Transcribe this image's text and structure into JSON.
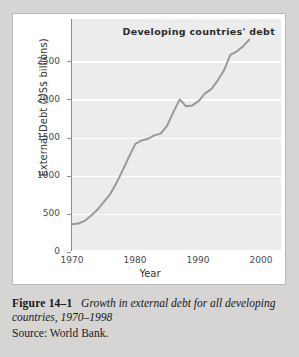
{
  "figure": {
    "label": "Figure 14–1",
    "title": "Growth in external debt for all developing countries, 1970–1998",
    "source": "Source: World Bank."
  },
  "chart_data": {
    "type": "line",
    "title": "Developing countries' debt",
    "xlabel": "Year",
    "ylabel": "External Debt (US$ billions)",
    "xlim": [
      1970,
      2003
    ],
    "ylim": [
      0,
      2700
    ],
    "xticks": [
      1970,
      1980,
      1990,
      2000
    ],
    "yticks": [
      0,
      500,
      1000,
      1500,
      2000,
      2500
    ],
    "ytick_labels": [
      "0",
      "500",
      "1000",
      "1500",
      "2000",
      "2500"
    ],
    "xtick_labels": [
      "1970",
      "1980",
      "1990",
      "2000"
    ],
    "grid": "horizontal-white",
    "legend": "none",
    "line_color": "#9a9a9a",
    "plot_background": "#ececec",
    "series": [
      {
        "name": "External debt of developing countries",
        "x": [
          1970,
          1971,
          1972,
          1973,
          1974,
          1975,
          1976,
          1977,
          1978,
          1979,
          1980,
          1981,
          1982,
          1983,
          1984,
          1985,
          1986,
          1987,
          1988,
          1989,
          1990,
          1991,
          1992,
          1993,
          1994,
          1995,
          1996,
          1997,
          1998
        ],
        "values": [
          300,
          310,
          340,
          400,
          470,
          560,
          650,
          780,
          930,
          1090,
          1240,
          1280,
          1300,
          1340,
          1360,
          1450,
          1610,
          1760,
          1680,
          1690,
          1740,
          1830,
          1880,
          1980,
          2100,
          2280,
          2320,
          2380,
          2460
        ]
      }
    ]
  }
}
